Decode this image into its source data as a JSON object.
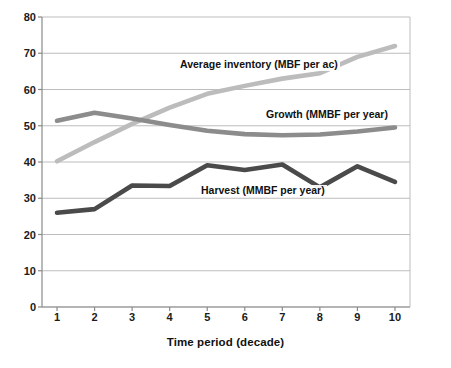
{
  "chart_data": {
    "type": "line",
    "title": "",
    "xlabel": "Time period (decade)",
    "ylabel": "",
    "x": [
      1,
      2,
      3,
      4,
      5,
      6,
      7,
      8,
      9,
      10
    ],
    "categories": [
      "1",
      "2",
      "3",
      "4",
      "5",
      "6",
      "7",
      "8",
      "9",
      "10"
    ],
    "xlim": [
      0.6,
      10.4
    ],
    "ylim": [
      0,
      80
    ],
    "yticks": [
      0,
      10,
      20,
      30,
      40,
      50,
      60,
      70,
      80
    ],
    "ytick_labels": [
      "0",
      "10",
      "20",
      "30",
      "40",
      "50",
      "60",
      "70",
      "80"
    ],
    "grid": "horizontal",
    "legend_position": "inline-annotations",
    "series": [
      {
        "name": "Average inventory (MBF per ac)",
        "color": "#bcbcbc",
        "values": [
          40.2,
          45.5,
          50.5,
          55.0,
          58.8,
          61.0,
          63.0,
          64.5,
          69.0,
          72.0
        ]
      },
      {
        "name": "Growth (MMBF per year)",
        "color": "#8c8c8c",
        "values": [
          51.4,
          53.6,
          52.0,
          50.2,
          48.6,
          47.7,
          47.4,
          47.6,
          48.4,
          49.5
        ]
      },
      {
        "name": "Harvest (MMBF per year)",
        "color": "#4a4a4a",
        "values": [
          26.0,
          27.0,
          33.5,
          33.4,
          39.1,
          37.8,
          39.3,
          33.0,
          38.8,
          34.5
        ]
      }
    ],
    "annotations": [
      {
        "text": "Average inventory (MBF per ac)",
        "series": "Average inventory (MBF per ac)"
      },
      {
        "text": "Growth (MMBF per year)",
        "series": "Growth (MMBF per year)"
      },
      {
        "text": "Harvest (MMBF per year)",
        "series": "Harvest (MMBF per year)"
      }
    ],
    "axis_color": "#8a8a8a",
    "gridline_color": "#b5b5b5",
    "background": "#ffffff"
  }
}
